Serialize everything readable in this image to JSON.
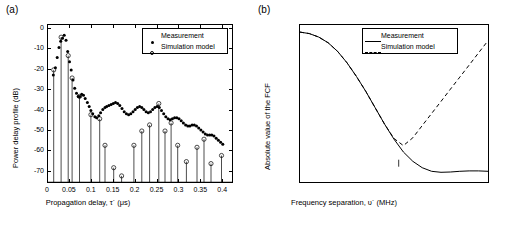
{
  "figure": {
    "panel_a_label": "(a)",
    "panel_b_label": "(b)"
  },
  "chart_data": [
    {
      "id": "panel_a",
      "type": "scatter",
      "title": "",
      "panel_label": "(a)",
      "xlabel": "Propagation delay, τ´ (μs)",
      "ylabel": "Power delay profile (dB)",
      "xlim": [
        0,
        0.42
      ],
      "ylim": [
        -75,
        2
      ],
      "xticks": [
        0,
        0.05,
        0.1,
        0.15,
        0.2,
        0.25,
        0.3,
        0.35,
        0.4
      ],
      "xticklabels": [
        "0",
        "0.05",
        "0.1",
        "0.15",
        "0.2",
        "0.25",
        "0.3",
        "0.35",
        "0.4"
      ],
      "yticks": [
        -70,
        -60,
        -50,
        -40,
        -30,
        -20,
        -10,
        0
      ],
      "yticklabels": [
        "-70",
        "-60",
        "-50",
        "-40",
        "-30",
        "-20",
        "-10",
        "0"
      ],
      "grid": false,
      "legend_position": "top-right",
      "legend": [
        "Measurement",
        "Simulation model"
      ],
      "series": [
        {
          "name": "Measurement",
          "marker": "filled-dot",
          "points": [
            [
              0.012,
              -22.5
            ],
            [
              0.017,
              -19.0
            ],
            [
              0.021,
              -14.0
            ],
            [
              0.025,
              -9.0
            ],
            [
              0.029,
              -6.0
            ],
            [
              0.033,
              -4.5
            ],
            [
              0.037,
              -3.0
            ],
            [
              0.041,
              -5.5
            ],
            [
              0.045,
              -11.0
            ],
            [
              0.049,
              -16.0
            ],
            [
              0.053,
              -20.0
            ],
            [
              0.057,
              -25.0
            ],
            [
              0.061,
              -29.0
            ],
            [
              0.065,
              -31.5
            ],
            [
              0.069,
              -33.0
            ],
            [
              0.073,
              -33.0
            ],
            [
              0.077,
              -32.0
            ],
            [
              0.081,
              -32.5
            ],
            [
              0.085,
              -34.0
            ],
            [
              0.09,
              -36.0
            ],
            [
              0.094,
              -38.0
            ],
            [
              0.098,
              -40.0
            ],
            [
              0.102,
              -41.5
            ],
            [
              0.107,
              -43.0
            ],
            [
              0.111,
              -43.5
            ],
            [
              0.116,
              -42.5
            ],
            [
              0.12,
              -41.0
            ],
            [
              0.125,
              -39.5
            ],
            [
              0.13,
              -38.5
            ],
            [
              0.134,
              -38.0
            ],
            [
              0.139,
              -37.5
            ],
            [
              0.144,
              -37.0
            ],
            [
              0.149,
              -36.5
            ],
            [
              0.154,
              -36.0
            ],
            [
              0.159,
              -36.5
            ],
            [
              0.164,
              -37.5
            ],
            [
              0.169,
              -39.0
            ],
            [
              0.174,
              -40.5
            ],
            [
              0.179,
              -41.5
            ],
            [
              0.184,
              -42.0
            ],
            [
              0.189,
              -41.5
            ],
            [
              0.194,
              -40.5
            ],
            [
              0.199,
              -39.5
            ],
            [
              0.204,
              -38.5
            ],
            [
              0.209,
              -38.0
            ],
            [
              0.214,
              -38.5
            ],
            [
              0.219,
              -39.5
            ],
            [
              0.224,
              -40.5
            ],
            [
              0.229,
              -41.0
            ],
            [
              0.234,
              -40.5
            ],
            [
              0.239,
              -39.5
            ],
            [
              0.244,
              -38.5
            ],
            [
              0.249,
              -38.0
            ],
            [
              0.254,
              -38.5
            ],
            [
              0.259,
              -40.0
            ],
            [
              0.264,
              -41.5
            ],
            [
              0.269,
              -43.0
            ],
            [
              0.274,
              -44.0
            ],
            [
              0.279,
              -44.5
            ],
            [
              0.284,
              -44.0
            ],
            [
              0.289,
              -43.5
            ],
            [
              0.294,
              -43.5
            ],
            [
              0.299,
              -44.0
            ],
            [
              0.304,
              -45.0
            ],
            [
              0.309,
              -46.0
            ],
            [
              0.314,
              -47.0
            ],
            [
              0.319,
              -47.5
            ],
            [
              0.324,
              -47.5
            ],
            [
              0.329,
              -47.0
            ],
            [
              0.334,
              -47.0
            ],
            [
              0.339,
              -47.5
            ],
            [
              0.344,
              -48.5
            ],
            [
              0.349,
              -49.5
            ],
            [
              0.354,
              -50.5
            ],
            [
              0.359,
              -51.5
            ],
            [
              0.364,
              -52.0
            ],
            [
              0.369,
              -52.0
            ],
            [
              0.374,
              -52.0
            ],
            [
              0.379,
              -52.5
            ],
            [
              0.384,
              -53.5
            ],
            [
              0.389,
              -54.5
            ],
            [
              0.394,
              -55.5
            ],
            [
              0.399,
              -56.5
            ]
          ]
        },
        {
          "name": "Simulation model",
          "marker": "open-circle-stem",
          "points": [
            [
              0.013,
              -20.0
            ],
            [
              0.03,
              -4.0
            ],
            [
              0.046,
              -13.0
            ],
            [
              0.055,
              -24.0
            ],
            [
              0.072,
              -33.0
            ],
            [
              0.098,
              -42.0
            ],
            [
              0.118,
              -44.0
            ],
            [
              0.13,
              -57.0
            ],
            [
              0.15,
              -68.0
            ],
            [
              0.168,
              -72.0
            ],
            [
              0.196,
              -57.0
            ],
            [
              0.214,
              -50.0
            ],
            [
              0.232,
              -47.0
            ],
            [
              0.253,
              -36.5
            ],
            [
              0.267,
              -50.0
            ],
            [
              0.281,
              -46.0
            ],
            [
              0.296,
              -57.0
            ],
            [
              0.316,
              -65.0
            ],
            [
              0.34,
              -58.0
            ],
            [
              0.356,
              -54.0
            ],
            [
              0.372,
              -66.0
            ],
            [
              0.396,
              -62.0
            ]
          ]
        }
      ]
    },
    {
      "id": "panel_b",
      "type": "line",
      "title": "",
      "panel_label": "(b)",
      "xlabel": "Frequency separation, υ´ (MHz)",
      "ylabel": "Absolute value of the FCF",
      "xlim": [
        0,
        40
      ],
      "ylim": [
        -0.05,
        1.05
      ],
      "xticks": [
        0,
        5,
        10,
        15,
        20,
        25,
        30,
        35,
        40
      ],
      "xticklabels": [
        "0",
        "5",
        "10",
        "15",
        "20",
        "25",
        "30",
        "35",
        "40"
      ],
      "yticks": [
        0,
        0.2,
        0.4,
        0.6,
        0.8,
        1
      ],
      "yticklabels": [
        "0",
        "0.2",
        "0.4",
        "0.6",
        "0.8",
        "1"
      ],
      "grid": false,
      "legend_position": "top-right",
      "legend": [
        "Measurement",
        "Simulation model"
      ],
      "annotations": [
        {
          "text": "υ´",
          "sub": "max",
          "x": 21.0,
          "y": 0.12
        }
      ],
      "series": [
        {
          "name": "Measurement",
          "style": "solid",
          "x": [
            0,
            2,
            4,
            6,
            8,
            10,
            12,
            14,
            16,
            18,
            20,
            22,
            24,
            26,
            28,
            30,
            32,
            34,
            36,
            38,
            40
          ],
          "y": [
            1.0,
            0.99,
            0.965,
            0.925,
            0.865,
            0.785,
            0.69,
            0.585,
            0.47,
            0.355,
            0.25,
            0.16,
            0.095,
            0.05,
            0.025,
            0.018,
            0.02,
            0.025,
            0.028,
            0.028,
            0.025
          ]
        },
        {
          "name": "Simulation model",
          "style": "dashed",
          "x": [
            0,
            2,
            4,
            6,
            8,
            10,
            12,
            14,
            16,
            18,
            20,
            22,
            24,
            26,
            28,
            30,
            32,
            34,
            36,
            38,
            40
          ],
          "y": [
            1.0,
            0.99,
            0.965,
            0.925,
            0.865,
            0.785,
            0.69,
            0.585,
            0.47,
            0.355,
            0.255,
            0.205,
            0.26,
            0.345,
            0.43,
            0.515,
            0.6,
            0.685,
            0.77,
            0.855,
            0.94
          ]
        }
      ]
    }
  ]
}
